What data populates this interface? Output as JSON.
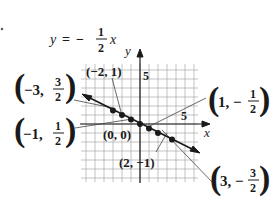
{
  "figure": {
    "equation": {
      "lhs": "y",
      "equals": "=",
      "sign": "−",
      "numerator": "1",
      "denominator": "2",
      "variable": "x"
    },
    "axes": {
      "x_label": "x",
      "y_label": "y",
      "x_tick_label": "5",
      "y_tick_label": "5"
    },
    "points": [
      {
        "id": "p1",
        "label": "(−3, 3/2)",
        "x": -3,
        "y": 1.5
      },
      {
        "id": "p2",
        "label": "(−2, 1)",
        "x": -2,
        "y": 1
      },
      {
        "id": "p3",
        "label": "(−1, 1/2)",
        "x": -1,
        "y": 0.5
      },
      {
        "id": "p4",
        "label": "(0, 0)",
        "x": 0,
        "y": 0
      },
      {
        "id": "p5",
        "label": "(1, −1/2)",
        "x": 1,
        "y": -0.5
      },
      {
        "id": "p6",
        "label": "(2, −1)",
        "x": 2,
        "y": -1
      },
      {
        "id": "p7",
        "label": "(3, −3/2)",
        "x": 3,
        "y": -1.5
      }
    ],
    "callouts": {
      "m3": {
        "open": "(",
        "a": "−3,",
        "num": "3",
        "den": "2",
        "close": ")"
      },
      "m2": "(−2, 1)",
      "m1": {
        "open": "(",
        "a": "−1,",
        "num": "1",
        "den": "2",
        "close": ")"
      },
      "z0": "(0, 0)",
      "p1": {
        "open": "(",
        "a": "1, −",
        "num": "1",
        "den": "2",
        "close": ")"
      },
      "p2": "(2, −1)",
      "p3": {
        "open": "(",
        "a": "3, −",
        "num": "3",
        "den": "2",
        "close": ")"
      }
    }
  },
  "chart_data": {
    "type": "line",
    "xlabel": "x",
    "ylabel": "y",
    "x": [
      -3,
      -2,
      -1,
      0,
      1,
      2,
      3
    ],
    "series": [
      {
        "name": "y = −1/2 x",
        "values": [
          1.5,
          1,
          0.5,
          0,
          -0.5,
          -1,
          -1.5
        ]
      }
    ],
    "annotations": [
      "(−3, 3/2)",
      "(−2, 1)",
      "(−1, 1/2)",
      "(0, 0)",
      "(1, −1/2)",
      "(2, −1)",
      "(3, −3/2)"
    ],
    "xlim": [
      -6.5,
      6.5
    ],
    "ylim": [
      -6.5,
      6.5
    ],
    "grid": true,
    "ticks_labeled": {
      "x": [
        5
      ],
      "y": [
        5
      ]
    }
  }
}
